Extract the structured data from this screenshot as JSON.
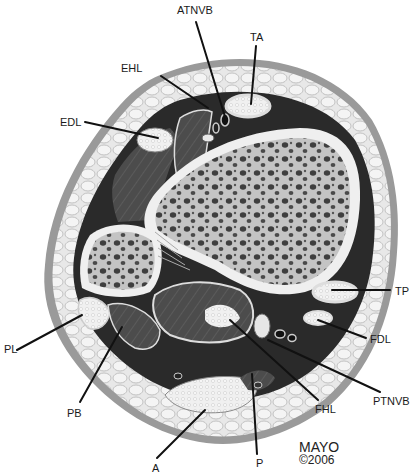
{
  "figure": {
    "colors": {
      "skin": "#9a9a9a",
      "fat": "#e6e6e6",
      "fat_cell_outline": "#b8b8b8",
      "muscle": "#4a4a4a",
      "bone_cortex": "#ececec",
      "bone_marrow": "#b9b9b9",
      "bone_pore": "#3e3e3e",
      "tendon": "#f2f2f2",
      "septum": "#1e1e1e",
      "leader": "#111111"
    }
  },
  "labels": [
    {
      "id": "atnvb",
      "text": "ATNVB"
    },
    {
      "id": "ta",
      "text": "TA"
    },
    {
      "id": "ehl",
      "text": "EHL"
    },
    {
      "id": "edl",
      "text": "EDL"
    },
    {
      "id": "tp",
      "text": "TP"
    },
    {
      "id": "fdl",
      "text": "FDL"
    },
    {
      "id": "pl",
      "text": "PL"
    },
    {
      "id": "pb",
      "text": "PB"
    },
    {
      "id": "fhl",
      "text": "FHL"
    },
    {
      "id": "ptnvb",
      "text": "PTNVB"
    },
    {
      "id": "a",
      "text": "A"
    },
    {
      "id": "p",
      "text": "P"
    }
  ],
  "credit": {
    "name": "MAYO",
    "year": "©2006"
  }
}
